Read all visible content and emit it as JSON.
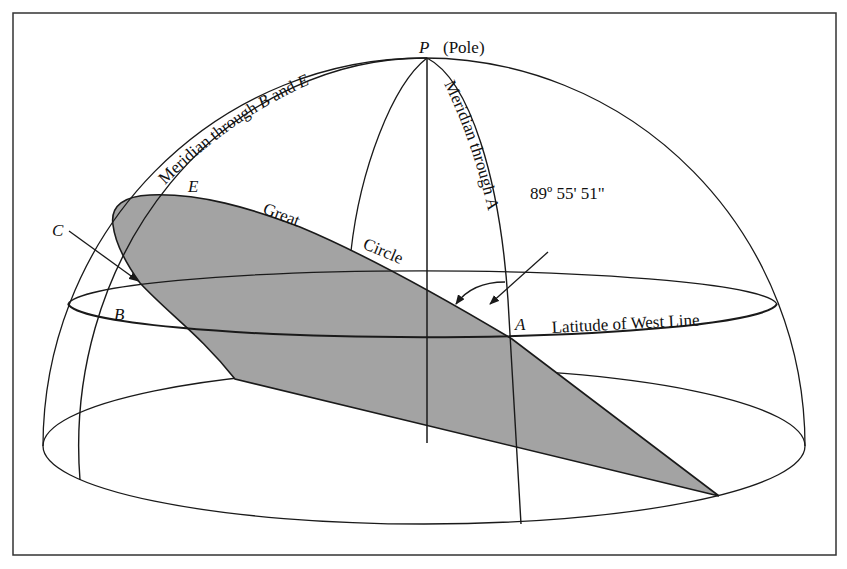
{
  "diagram": {
    "type": "spherical geometry illustration (hemisphere with great circle and latitude)",
    "colors": {
      "line": "#1a1a1a",
      "plane_fill": "#a3a3a3",
      "background": "#ffffff"
    },
    "labels": {
      "pole_letter": "P",
      "pole_text": "(Pole)",
      "meridian_be": "Meridian through B and E",
      "meridian_be_parts": [
        "Meridian through ",
        "B",
        " and ",
        "E"
      ],
      "meridian_a": "Meridian through A",
      "angle": "89º  55'  51\"",
      "great": "Great",
      "circle": "Circle",
      "latitude": "Latitude of West Line",
      "point_a": "A",
      "point_b": "B",
      "point_c": "C",
      "point_e": "E"
    }
  }
}
